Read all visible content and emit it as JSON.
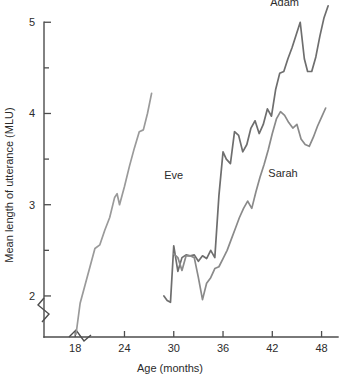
{
  "chart_data": {
    "type": "line",
    "title": "",
    "xlabel": "Age (months)",
    "ylabel": "Mean length of utterance (MLU)",
    "xlim": [
      14.2,
      50.0
    ],
    "ylim": [
      1.55,
      5.2
    ],
    "xticks": [
      18,
      24,
      30,
      36,
      42,
      48
    ],
    "xtick_labels": [
      "18",
      "24",
      "30",
      "36",
      "42",
      "48"
    ],
    "yticks": [
      2,
      2.5,
      3,
      3.5,
      4,
      4.5,
      5
    ],
    "ytick_labels": [
      "2",
      "",
      "3",
      "",
      "4",
      "",
      "5"
    ],
    "ytick_labeled": [
      2,
      3,
      4,
      5
    ],
    "grid": false,
    "legend_position": "inline-annotations",
    "axis_breaks": {
      "x_axis_break": true,
      "y_axis_break": true,
      "note": "zigzag break symbols near origin on both axes"
    },
    "colors": {
      "eve": "#9a9a9a",
      "adam": "#6e6e6e",
      "sarah": "#8a8a8a",
      "axis": "#4d4d4d",
      "text": "#2b2b2b",
      "background": "#ffffff"
    },
    "series": [
      {
        "name": "Eve",
        "color": "#9a9a9a",
        "label_x": 30.0,
        "label_y": 3.28,
        "x": [
          18.1,
          18.6,
          19.2,
          19.8,
          20.4,
          21.0,
          21.6,
          22.2,
          22.8,
          23.1,
          23.4,
          24.0,
          24.6,
          25.2,
          25.8,
          26.3,
          26.8,
          27.3
        ],
        "y": [
          1.58,
          1.92,
          2.12,
          2.32,
          2.52,
          2.56,
          2.72,
          2.86,
          3.08,
          3.12,
          3.0,
          3.2,
          3.42,
          3.62,
          3.8,
          3.82,
          4.0,
          4.22
        ]
      },
      {
        "name": "Adam",
        "color": "#6e6e6e",
        "label_x": 43.5,
        "label_y": 5.18,
        "x": [
          28.8,
          29.2,
          29.6,
          30.0,
          30.5,
          31.0,
          31.5,
          32.0,
          32.5,
          33.0,
          33.5,
          34.0,
          34.5,
          35.0,
          35.5,
          36.0,
          36.4,
          36.9,
          37.4,
          37.9,
          38.4,
          38.9,
          39.4,
          39.9,
          40.4,
          40.9,
          41.4,
          41.9,
          42.4,
          42.9,
          43.4,
          43.9,
          44.4,
          44.9,
          45.4,
          45.9,
          46.3,
          46.8,
          47.3,
          47.8,
          48.3,
          48.8
        ],
        "y": [
          2.0,
          1.95,
          1.93,
          2.55,
          2.27,
          2.42,
          2.45,
          2.44,
          2.45,
          2.38,
          2.44,
          2.41,
          2.5,
          2.42,
          3.1,
          3.58,
          3.5,
          3.45,
          3.8,
          3.76,
          3.58,
          3.66,
          3.84,
          3.92,
          3.78,
          3.88,
          4.05,
          3.97,
          4.26,
          4.44,
          4.46,
          4.6,
          4.72,
          4.86,
          5.0,
          4.6,
          4.46,
          4.46,
          4.62,
          4.85,
          5.05,
          5.18
        ]
      },
      {
        "name": "Sarah",
        "color": "#8a8a8a",
        "label_x": 43.3,
        "label_y": 3.3,
        "x": [
          30.0,
          30.5,
          31.0,
          31.5,
          32.0,
          32.5,
          33.0,
          33.5,
          34.0,
          34.5,
          35.0,
          35.5,
          36.0,
          36.5,
          37.0,
          37.5,
          38.0,
          38.5,
          39.0,
          39.5,
          40.0,
          40.5,
          41.0,
          41.5,
          42.0,
          42.5,
          43.0,
          43.5,
          44.0,
          44.5,
          45.0,
          45.5,
          46.0,
          46.5,
          47.0,
          47.5,
          48.0,
          48.5
        ],
        "y": [
          2.46,
          2.42,
          2.28,
          2.44,
          2.44,
          2.42,
          2.2,
          1.96,
          2.14,
          2.2,
          2.3,
          2.32,
          2.41,
          2.5,
          2.62,
          2.74,
          2.86,
          2.96,
          3.04,
          2.96,
          3.14,
          3.3,
          3.44,
          3.6,
          3.78,
          3.94,
          4.02,
          3.98,
          3.9,
          3.84,
          3.88,
          3.72,
          3.66,
          3.64,
          3.74,
          3.86,
          3.96,
          4.06
        ]
      }
    ]
  }
}
